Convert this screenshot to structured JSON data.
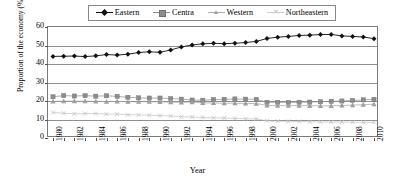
{
  "chart_data": {
    "type": "line",
    "title": "",
    "xlabel": "Year",
    "ylabel": "Proportion of the economy (%)",
    "ylim": [
      0,
      60
    ],
    "ytick_values": [
      0,
      10,
      20,
      30,
      40,
      50,
      60
    ],
    "xlim": [
      1980,
      2010
    ],
    "xtick_labels": [
      "1980",
      "1982",
      "1984",
      "1986",
      "1988",
      "1990",
      "1992",
      "1994",
      "1996",
      "1998",
      "2000",
      "2002",
      "2004",
      "2006",
      "2008",
      "2010"
    ],
    "grid": true,
    "legend_position": "top",
    "x": [
      1980,
      1981,
      1982,
      1983,
      1984,
      1985,
      1986,
      1987,
      1988,
      1989,
      1990,
      1991,
      1992,
      1993,
      1994,
      1995,
      1996,
      1997,
      1998,
      1999,
      2000,
      2001,
      2002,
      2003,
      2004,
      2005,
      2006,
      2007,
      2008,
      2009,
      2010
    ],
    "series": [
      {
        "name": "Eastern",
        "marker": "diamond",
        "color": "#111111",
        "values": [
          44.1,
          44.2,
          44.3,
          44.0,
          44.4,
          45.1,
          44.8,
          45.3,
          46.2,
          46.6,
          46.3,
          47.6,
          49.2,
          50.3,
          50.9,
          51.2,
          51.0,
          51.2,
          51.6,
          52.2,
          53.8,
          54.5,
          54.9,
          55.4,
          55.6,
          55.9,
          56.0,
          55.2,
          54.9,
          54.6,
          53.7
        ]
      },
      {
        "name": "Centra",
        "marker": "square",
        "color": "#8c8c8c",
        "values": [
          22.3,
          22.9,
          22.7,
          22.9,
          22.6,
          22.8,
          22.5,
          22.0,
          21.7,
          21.6,
          21.6,
          21.3,
          21.0,
          20.5,
          20.4,
          20.8,
          20.9,
          21.1,
          21.0,
          20.9,
          19.3,
          19.3,
          19.2,
          19.3,
          19.4,
          19.6,
          19.8,
          20.0,
          20.3,
          20.6,
          20.9
        ]
      },
      {
        "name": "Western",
        "marker": "triangle",
        "color": "#9e9e9e",
        "values": [
          19.8,
          19.9,
          19.9,
          19.9,
          19.8,
          19.7,
          19.8,
          19.6,
          19.6,
          19.6,
          19.5,
          19.4,
          19.3,
          19.4,
          19.0,
          18.9,
          18.8,
          18.8,
          18.7,
          18.6,
          17.6,
          17.5,
          17.5,
          17.5,
          17.4,
          17.4,
          17.4,
          17.6,
          17.8,
          18.0,
          18.3
        ]
      },
      {
        "name": "Northeastern",
        "marker": "cross",
        "color": "#c2c2c2",
        "values": [
          13.8,
          13.4,
          13.1,
          13.2,
          13.2,
          12.9,
          12.9,
          12.6,
          12.5,
          12.3,
          12.1,
          11.9,
          11.5,
          11.3,
          11.1,
          10.9,
          10.8,
          10.6,
          10.4,
          10.3,
          9.3,
          9.1,
          9.0,
          8.9,
          8.8,
          8.7,
          8.6,
          8.6,
          8.5,
          8.5,
          8.4
        ]
      }
    ]
  },
  "legend": {
    "items": [
      {
        "label": "Eastern"
      },
      {
        "label": "Centra"
      },
      {
        "label": "Western"
      },
      {
        "label": "Northeastern"
      }
    ]
  }
}
